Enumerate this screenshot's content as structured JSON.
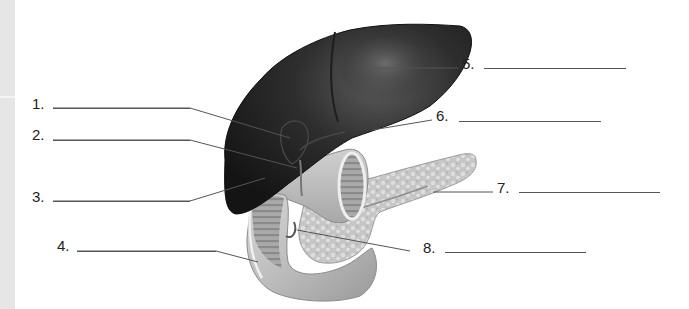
{
  "diagram": {
    "labels": [
      {
        "num": "1.",
        "answer": ""
      },
      {
        "num": "2.",
        "answer": ""
      },
      {
        "num": "3.",
        "answer": ""
      },
      {
        "num": "4.",
        "answer": ""
      },
      {
        "num": "5.",
        "answer": ""
      },
      {
        "num": "6.",
        "answer": ""
      },
      {
        "num": "7.",
        "answer": ""
      },
      {
        "num": "8.",
        "answer": ""
      }
    ]
  }
}
